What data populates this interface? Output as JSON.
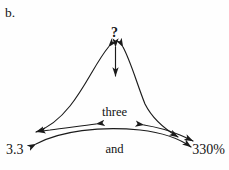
{
  "figure": {
    "part_label": "b.",
    "background_color": "#fefefe",
    "ink_color": "#1b1b1b",
    "kind": "concept-web-diagram"
  },
  "nodes": {
    "unknown": {
      "label": "?",
      "position": "top-center"
    },
    "words": {
      "lines": [
        "three",
        "and",
        "three",
        "tenths"
      ],
      "full_text": "three and three tenths",
      "position": "center"
    },
    "decimal": {
      "label": "3.3",
      "position": "bottom-left"
    },
    "percent": {
      "label": "330%",
      "position": "bottom-right"
    }
  },
  "connections": [
    {
      "name": "unknown-to-words",
      "from": "unknown",
      "to": "words",
      "style": "straight",
      "arrowheads": "both"
    },
    {
      "name": "unknown-to-decimal",
      "from": "unknown",
      "to": "decimal",
      "style": "curved",
      "arrowheads": "both"
    },
    {
      "name": "unknown-to-percent",
      "from": "unknown",
      "to": "percent",
      "style": "curved",
      "arrowheads": "both"
    },
    {
      "name": "words-to-decimal",
      "from": "words",
      "to": "decimal",
      "style": "curved",
      "arrowheads": "both"
    },
    {
      "name": "words-to-percent",
      "from": "words",
      "to": "percent",
      "style": "curved",
      "arrowheads": "both"
    },
    {
      "name": "decimal-to-percent",
      "from": "decimal",
      "to": "percent",
      "style": "curved",
      "arrowheads": "both"
    }
  ]
}
